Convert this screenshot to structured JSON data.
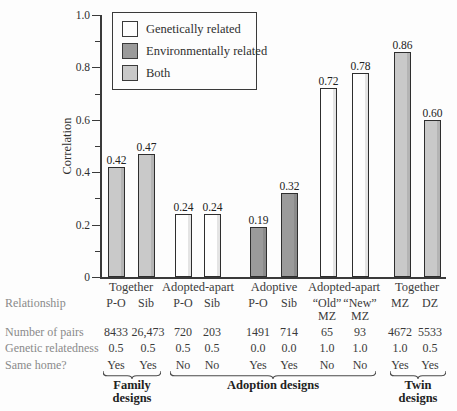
{
  "chart_data": {
    "type": "bar",
    "title": "",
    "ylabel": "Correlation",
    "ylim": [
      0,
      1.0
    ],
    "yticks": [
      "0",
      "0.2",
      "0.4",
      "0.6",
      "0.8",
      "1.0"
    ],
    "grid": false,
    "legend_position": "top-left-inside",
    "legend": [
      {
        "label": "Genetically related",
        "color": "#fefefe"
      },
      {
        "label": "Environmentally related",
        "color": "#9b9b9b"
      },
      {
        "label": "Both",
        "color": "#c9c9c9"
      }
    ],
    "groups": [
      {
        "label": "Together"
      },
      {
        "label": "Adopted-apart"
      },
      {
        "label": "Adoptive"
      },
      {
        "label": "Adopted-apart"
      },
      {
        "label": "Together"
      }
    ],
    "points": [
      {
        "group": "Together",
        "relationship": "P-O",
        "relationship_line2": "",
        "value": 0.42,
        "label": "0.42",
        "series": "Both",
        "pairs": "8433",
        "relatedness": "0.5",
        "same_home": "Yes"
      },
      {
        "group": "Together",
        "relationship": "Sib",
        "relationship_line2": "",
        "value": 0.47,
        "label": "0.47",
        "series": "Both",
        "pairs": "26,473",
        "relatedness": "0.5",
        "same_home": "Yes"
      },
      {
        "group": "Adopted-apart",
        "relationship": "P-O",
        "relationship_line2": "",
        "value": 0.24,
        "label": "0.24",
        "series": "Genetically related",
        "pairs": "720",
        "relatedness": "0.5",
        "same_home": "No"
      },
      {
        "group": "Adopted-apart",
        "relationship": "Sib",
        "relationship_line2": "",
        "value": 0.24,
        "label": "0.24",
        "series": "Genetically related",
        "pairs": "203",
        "relatedness": "0.5",
        "same_home": "No"
      },
      {
        "group": "Adoptive",
        "relationship": "P-O",
        "relationship_line2": "",
        "value": 0.19,
        "label": "0.19",
        "series": "Environmentally related",
        "pairs": "1491",
        "relatedness": "0.0",
        "same_home": "Yes"
      },
      {
        "group": "Adoptive",
        "relationship": "Sib",
        "relationship_line2": "",
        "value": 0.32,
        "label": "0.32",
        "series": "Environmentally related",
        "pairs": "714",
        "relatedness": "0.0",
        "same_home": "Yes"
      },
      {
        "group": "Adopted-apart",
        "relationship": "“Old”",
        "relationship_line2": "MZ",
        "value": 0.72,
        "label": "0.72",
        "series": "Genetically related",
        "pairs": "65",
        "relatedness": "1.0",
        "same_home": "No"
      },
      {
        "group": "Adopted-apart",
        "relationship": "“New”",
        "relationship_line2": "MZ",
        "value": 0.78,
        "label": "0.78",
        "series": "Genetically related",
        "pairs": "93",
        "relatedness": "1.0",
        "same_home": "No"
      },
      {
        "group": "Together",
        "relationship": "MZ",
        "relationship_line2": "",
        "value": 0.86,
        "label": "0.86",
        "series": "Both",
        "pairs": "4672",
        "relatedness": "1.0",
        "same_home": "Yes"
      },
      {
        "group": "Together",
        "relationship": "DZ",
        "relationship_line2": "",
        "value": 0.6,
        "label": "0.60",
        "series": "Both",
        "pairs": "5533",
        "relatedness": "0.5",
        "same_home": "Yes"
      }
    ]
  },
  "table": {
    "row_labels": {
      "relationship": "Relationship",
      "pairs": "Number of pairs",
      "relatedness": "Genetic relatedness",
      "same_home": "Same home?"
    }
  },
  "designs": [
    {
      "line1": "Family",
      "line2": "designs"
    },
    {
      "line1": "Adoption designs",
      "line2": ""
    },
    {
      "line1": "Twin",
      "line2": "designs"
    }
  ]
}
